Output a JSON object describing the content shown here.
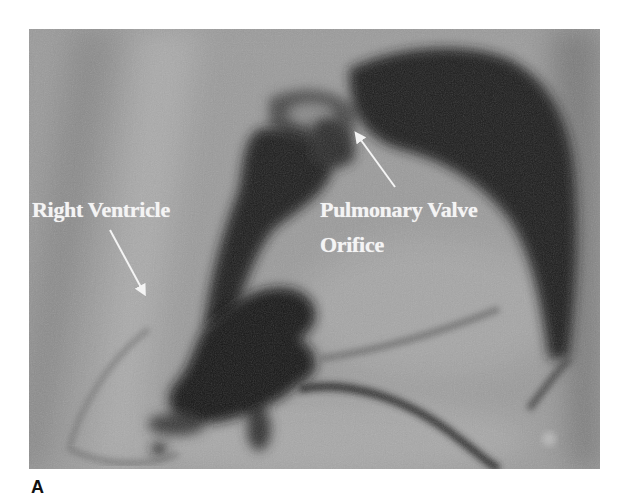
{
  "figure": {
    "panel_label": "A",
    "image_type": "angiogram",
    "annotations": [
      {
        "id": "right-ventricle",
        "text": "Right Ventricle",
        "arrow": {
          "from": [
            81,
            201
          ],
          "to": [
            117,
            268
          ]
        }
      },
      {
        "id": "pulmonary-valve",
        "lines": [
          "Pulmonary Valve",
          "Orifice"
        ],
        "arrow": {
          "from": [
            366,
            158
          ],
          "to": [
            325,
            101
          ]
        }
      }
    ],
    "colors": {
      "background": "#9a9a9a",
      "contrast_dark": "#1a1a1a",
      "annotation_text": "#f4f4f4",
      "page": "#ffffff"
    }
  }
}
